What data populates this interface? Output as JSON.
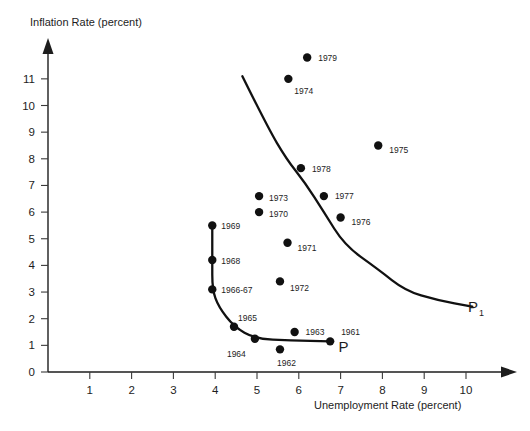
{
  "chart_data": {
    "type": "scatter",
    "title": "",
    "xlabel": "Unemployment Rate (percent)",
    "ylabel": "Inflation Rate (percent)",
    "xlim": [
      0,
      10.6
    ],
    "ylim": [
      0,
      11.8
    ],
    "grid": false,
    "legend": "none",
    "xticks": [
      "1",
      "2",
      "3",
      "4",
      "5",
      "6",
      "7",
      "8",
      "9",
      "10"
    ],
    "xtick_values": [
      1,
      2,
      3,
      4,
      5,
      6,
      7,
      8,
      9,
      10
    ],
    "yticks": [
      "0",
      "1",
      "2",
      "3",
      "4",
      "5",
      "6",
      "7",
      "8",
      "9",
      "10",
      "11"
    ],
    "ytick_values": [
      0,
      1,
      2,
      3,
      4,
      5,
      6,
      7,
      8,
      9,
      10,
      11
    ],
    "points": [
      {
        "label": "1961",
        "x": 6.75,
        "y": 1.15,
        "label_dx": 11,
        "label_dy": -9,
        "on_curve": true
      },
      {
        "label": "1962",
        "x": 5.55,
        "y": 0.85,
        "label_dx": -3,
        "label_dy": 14,
        "on_curve": false
      },
      {
        "label": "1963",
        "x": 5.9,
        "y": 1.5,
        "label_dx": 11,
        "label_dy": 0,
        "on_curve": false
      },
      {
        "label": "1964",
        "x": 4.95,
        "y": 1.25,
        "label_dx": -28,
        "label_dy": 15,
        "on_curve": true
      },
      {
        "label": "1965",
        "x": 4.45,
        "y": 1.7,
        "label_dx": 4,
        "label_dy": -9,
        "on_curve": true
      },
      {
        "label": "1966-67",
        "x": 3.93,
        "y": 3.1,
        "label_dx": 9,
        "label_dy": 1,
        "on_curve": true
      },
      {
        "label": "1968",
        "x": 3.93,
        "y": 4.2,
        "label_dx": 9,
        "label_dy": 1,
        "on_curve": true
      },
      {
        "label": "1969",
        "x": 3.93,
        "y": 5.5,
        "label_dx": 9,
        "label_dy": 1,
        "on_curve": true
      },
      {
        "label": "1970",
        "x": 5.05,
        "y": 6.0,
        "label_dx": 10,
        "label_dy": 2,
        "on_curve": false
      },
      {
        "label": "1971",
        "x": 5.73,
        "y": 4.85,
        "label_dx": 10,
        "label_dy": 5,
        "on_curve": false
      },
      {
        "label": "1972",
        "x": 5.55,
        "y": 3.4,
        "label_dx": 10,
        "label_dy": 7,
        "on_curve": false
      },
      {
        "label": "1973",
        "x": 5.05,
        "y": 6.6,
        "label_dx": 10,
        "label_dy": 2,
        "on_curve": false
      },
      {
        "label": "1974",
        "x": 5.75,
        "y": 11.0,
        "label_dx": 6,
        "label_dy": 12,
        "on_curve": false
      },
      {
        "label": "1975",
        "x": 7.9,
        "y": 8.5,
        "label_dx": 11,
        "label_dy": 5,
        "on_curve": false
      },
      {
        "label": "1976",
        "x": 7.0,
        "y": 5.8,
        "label_dx": 11,
        "label_dy": 5,
        "on_curve": false
      },
      {
        "label": "1977",
        "x": 6.6,
        "y": 6.6,
        "label_dx": 11,
        "label_dy": 0,
        "on_curve": false
      },
      {
        "label": "1978",
        "x": 6.05,
        "y": 7.65,
        "label_dx": 11,
        "label_dy": 1,
        "on_curve": false
      },
      {
        "label": "1979",
        "x": 6.2,
        "y": 11.8,
        "label_dx": 11,
        "label_dy": 0,
        "on_curve": false
      }
    ],
    "curves": [
      {
        "name": "P",
        "label": "P",
        "label_sub": "",
        "label_x": 6.95,
        "label_y": 0.75,
        "path": [
          {
            "x": 3.93,
            "y": 5.5
          },
          {
            "x": 3.93,
            "y": 4.2
          },
          {
            "x": 3.93,
            "y": 3.1
          },
          {
            "x": 4.08,
            "y": 2.45
          },
          {
            "x": 4.45,
            "y": 1.7
          },
          {
            "x": 4.95,
            "y": 1.25
          },
          {
            "x": 5.8,
            "y": 1.18
          },
          {
            "x": 6.75,
            "y": 1.15
          }
        ]
      },
      {
        "name": "P1",
        "label": "P",
        "label_sub": "1",
        "label_x": 10.05,
        "label_y": 2.25,
        "path": [
          {
            "x": 4.65,
            "y": 11.1
          },
          {
            "x": 5.25,
            "y": 9.2
          },
          {
            "x": 5.7,
            "y": 8.0
          },
          {
            "x": 6.15,
            "y": 7.1
          },
          {
            "x": 6.6,
            "y": 6.0
          },
          {
            "x": 7.1,
            "y": 4.75
          },
          {
            "x": 7.9,
            "y": 3.85
          },
          {
            "x": 8.55,
            "y": 3.05
          },
          {
            "x": 9.3,
            "y": 2.7
          },
          {
            "x": 10.15,
            "y": 2.45
          }
        ]
      }
    ]
  }
}
